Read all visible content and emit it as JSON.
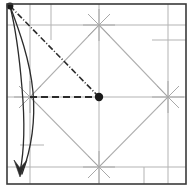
{
  "figure": {
    "width": 193,
    "height": 192,
    "background": "#ffffff"
  },
  "colors": {
    "border": "#3a3a3a",
    "grid": "#b3b3b3",
    "diamond": "#b0b0b0",
    "marker_star": "#9a9a9a",
    "dark_line": "#2b2b2b",
    "dot_fill": "#1a1a1a",
    "curve": "#2b2b2b"
  },
  "frame": {
    "label": "drawing-frame",
    "x": 7,
    "y": 4,
    "width": 179,
    "height": 180,
    "stroke_width": 1.6
  },
  "grid_lines": {
    "label": "construction-grid",
    "vertical": [
      {
        "name": "v-left-axis",
        "x": 30,
        "y1": 4,
        "y2": 184
      },
      {
        "name": "v-second",
        "x": 51,
        "y1": 4,
        "y2": 40
      },
      {
        "name": "v-center-axis",
        "x": 99,
        "y1": 4,
        "y2": 184
      },
      {
        "name": "v-right-axis",
        "x": 168,
        "y1": 4,
        "y2": 184
      },
      {
        "name": "v-lower-right-tick",
        "x": 144,
        "y1": 167,
        "y2": 184
      }
    ],
    "horizontal": [
      {
        "name": "h-upper",
        "x1": 7,
        "y": 25,
        "x2": 186
      },
      {
        "name": "h-upper-right-short",
        "x1": 152,
        "y": 40,
        "x2": 186
      },
      {
        "name": "h-center-axis",
        "x1": 7,
        "y": 97,
        "x2": 186
      },
      {
        "name": "h-lower-left-short",
        "x1": 20,
        "y": 145,
        "x2": 44
      },
      {
        "name": "h-lower",
        "x1": 7,
        "y": 167,
        "x2": 186
      }
    ]
  },
  "diamond": {
    "label": "rotated-square",
    "vertices": [
      {
        "name": "top-vertex",
        "x": 99,
        "y": 25
      },
      {
        "name": "right-vertex",
        "x": 168,
        "y": 97
      },
      {
        "name": "bottom-vertex",
        "x": 99,
        "y": 167
      },
      {
        "name": "left-vertex",
        "x": 30,
        "y": 97
      }
    ]
  },
  "star_markers": {
    "label": "vertex-cross-markers",
    "radius": 16,
    "points": [
      {
        "name": "star-top",
        "x": 99,
        "y": 25
      },
      {
        "name": "star-right",
        "x": 168,
        "y": 97
      },
      {
        "name": "star-bottom",
        "x": 99,
        "y": 167
      },
      {
        "name": "star-left",
        "x": 30,
        "y": 97
      }
    ]
  },
  "dash_dot_line": {
    "label": "dash-dot-ray",
    "from": {
      "x": 10,
      "y": 6
    },
    "to": {
      "x": 99,
      "y": 97
    },
    "pattern": "6 2 1 2",
    "stroke_width": 1.6
  },
  "dashed_line": {
    "label": "horizontal-dashed-segment",
    "from": {
      "x": 30,
      "y": 97
    },
    "to": {
      "x": 99,
      "y": 97
    },
    "pattern": "7 4",
    "stroke_width": 2.0
  },
  "dots": [
    {
      "name": "origin-dot-top-left",
      "x": 10,
      "y": 6,
      "r": 3.4
    },
    {
      "name": "center-dot",
      "x": 99,
      "y": 97,
      "r": 4.2
    }
  ],
  "curve": {
    "label": "swept-trajectory-loop",
    "outer_path": "M 10 6 C 14 22 19 52 22 88 C 25 122 24 152 20 172",
    "inner_path": "M 10 6 C 19 30 30 60 33 92 C 36 126 29 155 22 174",
    "arrowhead": {
      "name": "direction-arrowhead",
      "points": "14 160 20 176 27 160 20 168",
      "tip": {
        "x": 20,
        "y": 177
      }
    },
    "stroke_width": 1.3
  }
}
